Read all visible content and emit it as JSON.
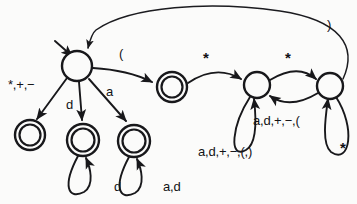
{
  "diagram": {
    "kind": "finite-state-automaton",
    "title": "",
    "background_color": "#fbfbfa",
    "ink_color": "#18181b",
    "states": [
      {
        "id": "start",
        "name": "start-state",
        "accepting": false,
        "cx": 77,
        "cy": 66,
        "r": 15
      },
      {
        "id": "acc_sym",
        "name": "accepting-state-operator",
        "accepting": true,
        "cx": 30,
        "cy": 135,
        "r": 15
      },
      {
        "id": "acc_num",
        "name": "accepting-state-number",
        "accepting": true,
        "cx": 83,
        "cy": 140,
        "r": 16
      },
      {
        "id": "acc_id",
        "name": "accepting-state-identifier",
        "accepting": true,
        "cx": 134,
        "cy": 141,
        "r": 16
      },
      {
        "id": "acc_paren",
        "name": "accepting-state-open-paren",
        "accepting": true,
        "cx": 172,
        "cy": 87,
        "r": 15
      },
      {
        "id": "cmt_a",
        "name": "comment-state-inner",
        "accepting": false,
        "cx": 257,
        "cy": 85,
        "r": 13
      },
      {
        "id": "cmt_b",
        "name": "comment-state-star",
        "accepting": false,
        "cx": 330,
        "cy": 86,
        "r": 13
      }
    ],
    "transitions": [
      {
        "id": "t_start_sym",
        "name": "transition-start-to-operator",
        "label": "*,+,−",
        "label_x": 8,
        "label_y": 78
      },
      {
        "id": "t_start_num",
        "name": "transition-start-to-number",
        "label": "d",
        "label_x": 66,
        "label_y": 98
      },
      {
        "id": "t_start_id",
        "name": "transition-start-to-identifier",
        "label": "a",
        "label_x": 106,
        "label_y": 85
      },
      {
        "id": "t_start_paren",
        "name": "transition-start-to-open-paren",
        "label": "(",
        "label_x": 119,
        "label_y": 47
      },
      {
        "id": "t_paren_cmt",
        "name": "transition-open-paren-to-comment",
        "label": "*",
        "label_x": 203,
        "label_y": 50
      },
      {
        "id": "t_cmt_star",
        "name": "transition-comment-to-star",
        "label": "*",
        "label_x": 285,
        "label_y": 50
      },
      {
        "id": "t_star_back",
        "name": "transition-star-back-to-comment",
        "label": "a,d,+,−,(",
        "label_x": 253,
        "label_y": 114
      },
      {
        "id": "t_cmt_loop",
        "name": "self-loop-comment-state",
        "label": "a,d,+,−,(,)",
        "label_x": 198,
        "label_y": 145
      },
      {
        "id": "t_star_loop",
        "name": "self-loop-star-state",
        "label": "*",
        "label_x": 340,
        "label_y": 140
      },
      {
        "id": "t_num_loop",
        "name": "self-loop-number-state",
        "label": "d",
        "label_x": 114,
        "label_y": 180
      },
      {
        "id": "t_id_loop",
        "name": "self-loop-identifier-state",
        "label": "a,d",
        "label_x": 163,
        "label_y": 180
      },
      {
        "id": "t_return",
        "name": "transition-star-to-start-close-paren",
        "label": ")",
        "label_x": 327,
        "label_y": 18
      }
    ],
    "alphabet_legend": {
      "a": "letter",
      "d": "digit"
    }
  }
}
